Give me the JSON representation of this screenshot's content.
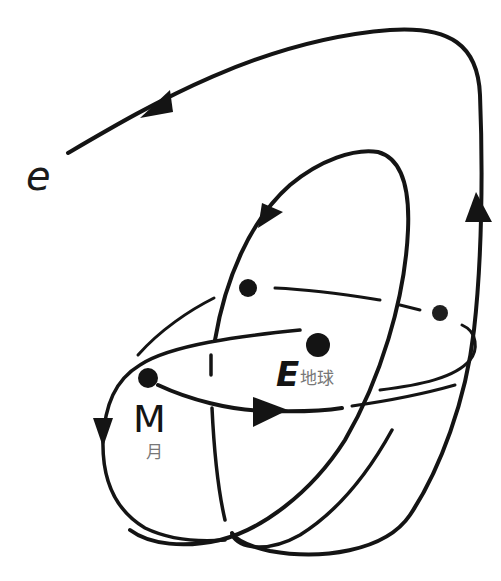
{
  "diagram": {
    "title": "",
    "labels": {
      "electron": "e",
      "earth": "E",
      "earth_cn": "地球",
      "moon": "M",
      "moon_cn": "月"
    },
    "bodies": [
      {
        "id": "earth",
        "x": 318,
        "y": 345,
        "r": 12
      },
      {
        "id": "moon",
        "x": 148,
        "y": 378,
        "r": 10
      },
      {
        "id": "node-left",
        "x": 248,
        "y": 288,
        "r": 9
      },
      {
        "id": "node-right",
        "x": 440,
        "y": 313,
        "r": 8
      }
    ],
    "colors": {
      "ink": "#141414",
      "label_gray": "#777777",
      "background": "#ffffff"
    }
  }
}
